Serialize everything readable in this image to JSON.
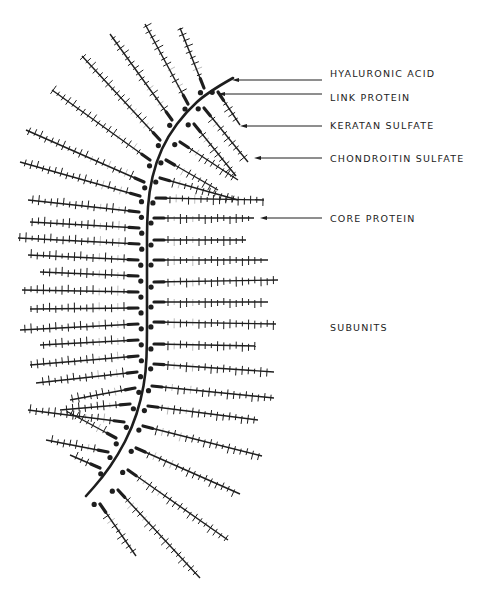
{
  "diagram": {
    "colors": {
      "ink": "#1e1e1e",
      "background": "#ffffff"
    },
    "labels": [
      {
        "id": "hyaluronic-acid",
        "text": "HYALURONIC ACID",
        "x": 330,
        "y": 68,
        "arrow_from": 232,
        "arrow_to": 322,
        "arrow_y": 80
      },
      {
        "id": "link-protein",
        "text": "LINK PROTEIN",
        "x": 330,
        "y": 92,
        "arrow_from": 218,
        "arrow_to": 322,
        "arrow_y": 94
      },
      {
        "id": "keratan-sulfate",
        "text": "KERATAN SULFATE",
        "x": 330,
        "y": 120,
        "arrow_from": 240,
        "arrow_to": 322,
        "arrow_y": 126
      },
      {
        "id": "chondroitin-sulfate",
        "text": "CHONDROITIN SULFATE",
        "x": 330,
        "y": 153,
        "arrow_from": 254,
        "arrow_to": 322,
        "arrow_y": 158
      },
      {
        "id": "core-protein",
        "text": "CORE PROTEIN",
        "x": 330,
        "y": 213,
        "arrow_from": 260,
        "arrow_to": 322,
        "arrow_y": 218
      },
      {
        "id": "subunits",
        "text": "SUBUNITS",
        "x": 330,
        "y": 322
      }
    ],
    "spine": [
      [
        233,
        78
      ],
      [
        208,
        92
      ],
      [
        186,
        112
      ],
      [
        168,
        136
      ],
      [
        156,
        162
      ],
      [
        149,
        192
      ],
      [
        147,
        222
      ],
      [
        147,
        252
      ],
      [
        147,
        282
      ],
      [
        147,
        312
      ],
      [
        147,
        342
      ],
      [
        146,
        372
      ],
      [
        141,
        400
      ],
      [
        132,
        428
      ],
      [
        118,
        455
      ],
      [
        102,
        478
      ],
      [
        86,
        496
      ]
    ],
    "subunits_left": [
      {
        "a": [
          204,
          88
        ],
        "b": [
          180,
          28
        ]
      },
      {
        "a": [
          188,
          104
        ],
        "b": [
          145,
          24
        ]
      },
      {
        "a": [
          172,
          120
        ],
        "b": [
          110,
          34
        ]
      },
      {
        "a": [
          160,
          140
        ],
        "b": [
          82,
          56
        ]
      },
      {
        "a": [
          150,
          160
        ],
        "b": [
          52,
          90
        ]
      },
      {
        "a": [
          144,
          182
        ],
        "b": [
          26,
          130
        ]
      },
      {
        "a": [
          140,
          196
        ],
        "b": [
          20,
          162
        ]
      },
      {
        "a": [
          139,
          212
        ],
        "b": [
          28,
          200
        ]
      },
      {
        "a": [
          139,
          228
        ],
        "b": [
          30,
          222
        ]
      },
      {
        "a": [
          139,
          244
        ],
        "b": [
          18,
          238
        ]
      },
      {
        "a": [
          138,
          260
        ],
        "b": [
          28,
          255
        ]
      },
      {
        "a": [
          138,
          276
        ],
        "b": [
          40,
          272
        ]
      },
      {
        "a": [
          138,
          292
        ],
        "b": [
          22,
          290
        ]
      },
      {
        "a": [
          138,
          308
        ],
        "b": [
          30,
          309
        ]
      },
      {
        "a": [
          138,
          324
        ],
        "b": [
          20,
          330
        ]
      },
      {
        "a": [
          138,
          340
        ],
        "b": [
          40,
          345
        ]
      },
      {
        "a": [
          138,
          356
        ],
        "b": [
          30,
          365
        ]
      },
      {
        "a": [
          137,
          372
        ],
        "b": [
          36,
          383
        ]
      },
      {
        "a": [
          135,
          388
        ],
        "b": [
          70,
          400
        ]
      },
      {
        "a": [
          130,
          404
        ],
        "b": [
          60,
          410
        ]
      },
      {
        "a": [
          124,
          422
        ],
        "b": [
          28,
          410
        ]
      },
      {
        "a": [
          116,
          438
        ],
        "b": [
          68,
          412
        ]
      },
      {
        "a": [
          108,
          452
        ],
        "b": [
          46,
          440
        ]
      },
      {
        "a": [
          100,
          468
        ],
        "b": [
          70,
          455
        ]
      }
    ],
    "subunits_right": [
      {
        "a": [
          218,
          92
        ],
        "b": [
          240,
          125
        ]
      },
      {
        "a": [
          204,
          108
        ],
        "b": [
          248,
          162
        ]
      },
      {
        "a": [
          194,
          124
        ],
        "b": [
          236,
          176
        ]
      },
      {
        "a": [
          180,
          142
        ],
        "b": [
          238,
          180
        ]
      },
      {
        "a": [
          166,
          160
        ],
        "b": [
          218,
          190
        ]
      },
      {
        "a": [
          160,
          178
        ],
        "b": [
          238,
          200
        ]
      },
      {
        "a": [
          156,
          198
        ],
        "b": [
          264,
          200
        ]
      },
      {
        "a": [
          154,
          218
        ],
        "b": [
          254,
          218
        ]
      },
      {
        "a": [
          154,
          240
        ],
        "b": [
          246,
          240
        ]
      },
      {
        "a": [
          154,
          260
        ],
        "b": [
          268,
          260
        ]
      },
      {
        "a": [
          154,
          282
        ],
        "b": [
          278,
          280
        ]
      },
      {
        "a": [
          154,
          302
        ],
        "b": [
          268,
          302
        ]
      },
      {
        "a": [
          154,
          322
        ],
        "b": [
          276,
          324
        ]
      },
      {
        "a": [
          154,
          344
        ],
        "b": [
          256,
          346
        ]
      },
      {
        "a": [
          154,
          364
        ],
        "b": [
          274,
          372
        ]
      },
      {
        "a": [
          152,
          386
        ],
        "b": [
          274,
          398
        ]
      },
      {
        "a": [
          148,
          406
        ],
        "b": [
          258,
          420
        ]
      },
      {
        "a": [
          143,
          426
        ],
        "b": [
          262,
          456
        ]
      },
      {
        "a": [
          136,
          448
        ],
        "b": [
          240,
          494
        ]
      },
      {
        "a": [
          128,
          470
        ],
        "b": [
          228,
          540
        ]
      },
      {
        "a": [
          118,
          490
        ],
        "b": [
          200,
          578
        ]
      },
      {
        "a": [
          100,
          504
        ],
        "b": [
          136,
          556
        ]
      }
    ]
  }
}
